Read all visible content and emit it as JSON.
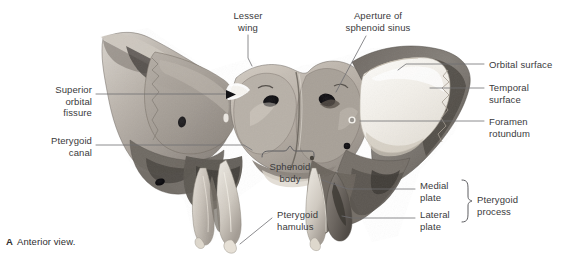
{
  "figure": {
    "caption_letter": "A",
    "caption_text": "Anterior view.",
    "image_type": "grayscale anatomical photograph",
    "background_color": "#ffffff",
    "label_color": "#3a3a3c",
    "leader_color": "#6e6e72"
  },
  "labels": [
    {
      "id": "lesser-wing",
      "text": "Lesser\nwing",
      "align": "center",
      "x": 248,
      "y": 10
    },
    {
      "id": "aperture-sinus",
      "text": "Aperture of\nsphenoid sinus",
      "align": "center",
      "x": 378,
      "y": 10
    },
    {
      "id": "orbital-surface",
      "text": "Orbital surface",
      "align": "left",
      "x": 489,
      "y": 60
    },
    {
      "id": "temporal-surface",
      "text": "Temporal\nsurface",
      "align": "left",
      "x": 489,
      "y": 83
    },
    {
      "id": "foramen-rotundum",
      "text": "Foramen\nrotundum",
      "align": "left",
      "x": 489,
      "y": 117
    },
    {
      "id": "superior-orbital-fissure",
      "text": "Superior\norbital\nfissure",
      "align": "right",
      "x": 90,
      "y": 88
    },
    {
      "id": "pterygoid-canal",
      "text": "Pterygoid\ncanal",
      "align": "right",
      "x": 90,
      "y": 139
    },
    {
      "id": "sphenoid-body",
      "text": "Sphenoid\nbody",
      "align": "center",
      "x": 290,
      "y": 166
    },
    {
      "id": "pterygoid-hamulus",
      "text": "Pterygoid\nhamulus",
      "align": "left",
      "x": 277,
      "y": 214
    },
    {
      "id": "medial-plate",
      "text": "Medial\nplate",
      "align": "left",
      "x": 420,
      "y": 185
    },
    {
      "id": "lateral-plate",
      "text": "Lateral\nplate",
      "align": "left",
      "x": 420,
      "y": 214
    },
    {
      "id": "pterygoid-process",
      "text": "Pterygoid\nprocess",
      "align": "left",
      "x": 474,
      "y": 199
    }
  ],
  "anatomy_parts": [
    "lesser wing",
    "greater wing",
    "orbital surface",
    "temporal surface",
    "sphenoid body",
    "aperture of sphenoid sinus",
    "superior orbital fissure",
    "foramen rotundum",
    "pterygoid canal",
    "medial pterygoid plate",
    "lateral pterygoid plate",
    "pterygoid hamulus"
  ]
}
